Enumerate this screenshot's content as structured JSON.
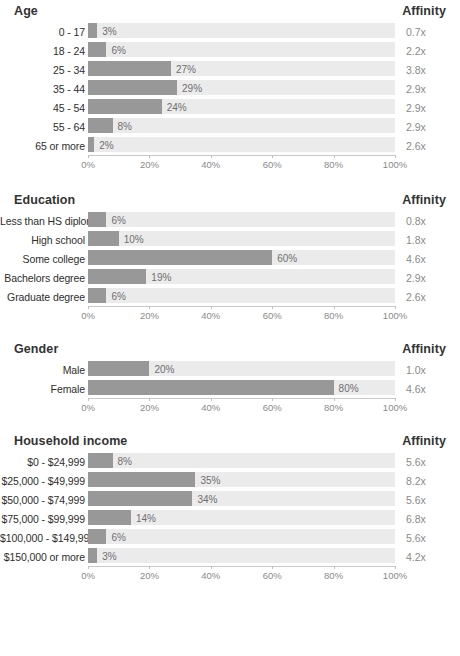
{
  "affinity_header_label": "Affinity",
  "colors": {
    "bar_fill": "#989898",
    "track": "#ebebeb",
    "title_text": "#333333",
    "label_text": "#2e2e2e",
    "value_text": "#6e6e6e",
    "affinity_text": "#8a8a8a",
    "axis": "#c8c8c8",
    "background": "#ffffff"
  },
  "axis": {
    "ticks": [
      "0%",
      "20%",
      "40%",
      "60%",
      "80%",
      "100%"
    ],
    "tick_values": [
      0,
      20,
      40,
      60,
      80,
      100
    ],
    "min": 0,
    "max": 100
  },
  "chart_data": {
    "type": "bar",
    "title": "",
    "xlabel": "",
    "ylabel": "",
    "xlim": [
      0,
      100
    ],
    "grid": false,
    "orientation": "horizontal",
    "legend": "none",
    "panels": [
      {
        "title": "Age",
        "affinity_header": "Affinity",
        "categories": [
          "0 - 17",
          "18 - 24",
          "25 - 34",
          "35 - 44",
          "45 - 54",
          "55 - 64",
          "65 or more"
        ],
        "values": [
          3,
          6,
          27,
          29,
          24,
          8,
          2
        ],
        "value_labels": [
          "3%",
          "6%",
          "27%",
          "29%",
          "24%",
          "8%",
          "2%"
        ],
        "affinity": [
          0.7,
          2.2,
          3.8,
          2.9,
          2.9,
          2.9,
          2.6
        ],
        "affinity_labels": [
          "0.7x",
          "2.2x",
          "3.8x",
          "2.9x",
          "2.9x",
          "2.9x",
          "2.6x"
        ]
      },
      {
        "title": "Education",
        "affinity_header": "Affinity",
        "categories": [
          "Less than HS diploma",
          "High school",
          "Some college",
          "Bachelors degree",
          "Graduate degree"
        ],
        "values": [
          6,
          10,
          60,
          19,
          6
        ],
        "value_labels": [
          "6%",
          "10%",
          "60%",
          "19%",
          "6%"
        ],
        "affinity": [
          0.8,
          1.8,
          4.6,
          2.9,
          2.6
        ],
        "affinity_labels": [
          "0.8x",
          "1.8x",
          "4.6x",
          "2.9x",
          "2.6x"
        ]
      },
      {
        "title": "Gender",
        "affinity_header": "Affinity",
        "categories": [
          "Male",
          "Female"
        ],
        "values": [
          20,
          80
        ],
        "value_labels": [
          "20%",
          "80%"
        ],
        "affinity": [
          1.0,
          4.6
        ],
        "affinity_labels": [
          "1.0x",
          "4.6x"
        ]
      },
      {
        "title": "Household income",
        "affinity_header": "Affinity",
        "categories": [
          "$0 - $24,999",
          "$25,000 - $49,999",
          "$50,000 - $74,999",
          "$75,000 - $99,999",
          "$100,000 - $149,999",
          "$150,000 or more"
        ],
        "values": [
          8,
          35,
          34,
          14,
          6,
          3
        ],
        "value_labels": [
          "8%",
          "35%",
          "34%",
          "14%",
          "6%",
          "3%"
        ],
        "affinity": [
          5.6,
          8.2,
          5.6,
          6.8,
          5.6,
          4.2
        ],
        "affinity_labels": [
          "5.6x",
          "8.2x",
          "5.6x",
          "6.8x",
          "5.6x",
          "4.2x"
        ]
      }
    ]
  }
}
